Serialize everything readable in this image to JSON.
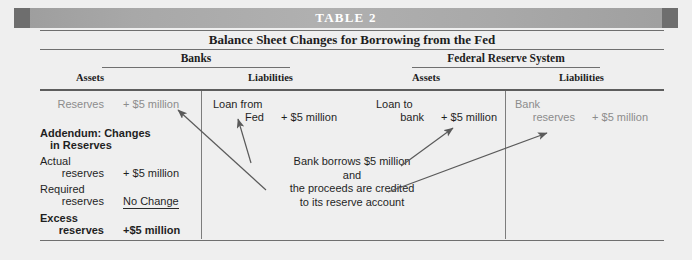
{
  "table": {
    "number_label": "TABLE 2",
    "caption": "Balance Sheet Changes for Borrowing from the Fed",
    "groups": [
      {
        "name": "Banks",
        "columns": [
          "Assets",
          "Liabilities"
        ]
      },
      {
        "name": "Federal Reserve System",
        "columns": [
          "Assets",
          "Liabilities"
        ]
      }
    ],
    "banks_assets": {
      "top_entry": {
        "label": "Reserves",
        "value": "+ $5 million"
      },
      "addendum_title_line1": "Addendum: Changes",
      "addendum_title_line2": "in Reserves",
      "rows": [
        {
          "label_line1": "Actual",
          "label_line2": "reserves",
          "value": "+ $5 million",
          "bold": false,
          "underline": false
        },
        {
          "label_line1": "Required",
          "label_line2": "reserves",
          "value": "No Change",
          "bold": false,
          "underline": true
        },
        {
          "label_line1": "Excess",
          "label_line2": "reserves",
          "value": "+$5 million",
          "bold": true,
          "underline": false
        }
      ]
    },
    "banks_liabilities": {
      "label_line1": "Loan from",
      "label_line2": "Fed",
      "value": "+ $5 million"
    },
    "fed_assets": {
      "label_line1": "Loan to",
      "label_line2": "bank",
      "value": "+ $5 million"
    },
    "fed_liabilities": {
      "label_line1": "Bank",
      "label_line2": "reserves",
      "value": "+ $5 million"
    },
    "annotation": {
      "line1": "Bank borrows $5 million",
      "line2": "and",
      "line3": "the proceeds are credited",
      "line4": "to its reserve account"
    }
  },
  "colors": {
    "title_bar": "#ababab",
    "title_cap": "#6e6e6e",
    "page_bg": "#efefef",
    "rule": "#6f6f6f",
    "text": "#1f1f1f",
    "muted_text": "#8c8c8c",
    "arrow": "#5a5a5a"
  }
}
